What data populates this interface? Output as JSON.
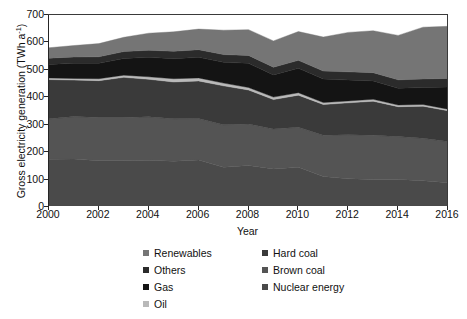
{
  "chart_data": {
    "type": "area",
    "stacked": true,
    "title": "",
    "xlabel": "Year",
    "ylabel": "Gross electricity generation (TWh a⁻¹)",
    "ylabel_text": "Gross electricity generation (TWh a",
    "ylabel_sup": "-1",
    "ylabel_tail": ")",
    "xlim": [
      2000,
      2016
    ],
    "ylim": [
      0,
      700
    ],
    "ytick_step": 100,
    "xtick_step": 2,
    "grid": false,
    "legend_position": "below-center",
    "x": [
      2000,
      2001,
      2002,
      2003,
      2004,
      2005,
      2006,
      2007,
      2008,
      2009,
      2010,
      2011,
      2012,
      2013,
      2014,
      2015,
      2016
    ],
    "xticklabels": [
      "2000",
      "2002",
      "2004",
      "2006",
      "2008",
      "2010",
      "2012",
      "2014",
      "2016"
    ],
    "yticklabels": [
      "0",
      "100",
      "200",
      "300",
      "400",
      "500",
      "600",
      "700"
    ],
    "stack_order_bottom_to_top": [
      "Nuclear energy",
      "Brown coal",
      "Hard coal",
      "Oil",
      "Gas",
      "Others",
      "Renewables"
    ],
    "series": [
      {
        "name": "Nuclear energy",
        "color": "#4a4a4a",
        "values": [
          170,
          171,
          165,
          165,
          167,
          163,
          168,
          141,
          148,
          135,
          141,
          108,
          99,
          97,
          97,
          92,
          85
        ]
      },
      {
        "name": "Brown coal",
        "color": "#545454",
        "values": [
          148,
          155,
          158,
          158,
          158,
          155,
          151,
          155,
          151,
          146,
          146,
          150,
          161,
          161,
          156,
          155,
          150
        ]
      },
      {
        "name": "Hard coal",
        "color": "#3a3a3a",
        "values": [
          143,
          133,
          134,
          146,
          137,
          134,
          137,
          142,
          124,
          107,
          117,
          112,
          116,
          124,
          109,
          117,
          112
        ]
      },
      {
        "name": "Oil",
        "color": "#b9b9b9",
        "values": [
          6,
          6,
          7,
          8,
          9,
          12,
          11,
          10,
          9,
          9,
          9,
          7,
          7,
          7,
          6,
          6,
          6
        ]
      },
      {
        "name": "Gas",
        "color": "#141414",
        "values": [
          49,
          55,
          56,
          61,
          71,
          73,
          75,
          76,
          88,
          81,
          89,
          86,
          76,
          67,
          61,
          62,
          81
        ]
      },
      {
        "name": "Others",
        "color": "#2b2b2b",
        "values": [
          23,
          23,
          24,
          25,
          26,
          27,
          28,
          28,
          29,
          28,
          29,
          29,
          30,
          30,
          31,
          31,
          31
        ]
      },
      {
        "name": "Renewables",
        "color": "#757575",
        "values": [
          38,
          42,
          48,
          52,
          62,
          71,
          75,
          89,
          94,
          96,
          105,
          124,
          144,
          153,
          162,
          189,
          190
        ]
      }
    ],
    "totals": [
      577,
      585,
      592,
      615,
      630,
      635,
      645,
      641,
      643,
      602,
      636,
      616,
      633,
      639,
      622,
      652,
      655
    ]
  },
  "legend": {
    "columns": [
      {
        "items": [
          {
            "label": "Renewables",
            "color": "#757575",
            "swatch_name": "swatch-renewables"
          },
          {
            "label": "Others",
            "color": "#2b2b2b",
            "swatch_name": "swatch-others"
          },
          {
            "label": "Gas",
            "color": "#141414",
            "swatch_name": "swatch-gas"
          },
          {
            "label": "Oil",
            "color": "#b9b9b9",
            "swatch_name": "swatch-oil"
          }
        ]
      },
      {
        "items": [
          {
            "label": "Hard coal",
            "color": "#3a3a3a",
            "swatch_name": "swatch-hard-coal"
          },
          {
            "label": "Brown coal",
            "color": "#545454",
            "swatch_name": "swatch-brown-coal"
          },
          {
            "label": "Nuclear energy",
            "color": "#4a4a4a",
            "swatch_name": "swatch-nuclear-energy"
          }
        ]
      }
    ]
  },
  "axes": {
    "x_title": "Year",
    "y_title_main": "Gross electricity generation (TWh a",
    "y_title_sup": "-1",
    "y_title_end": ")"
  }
}
